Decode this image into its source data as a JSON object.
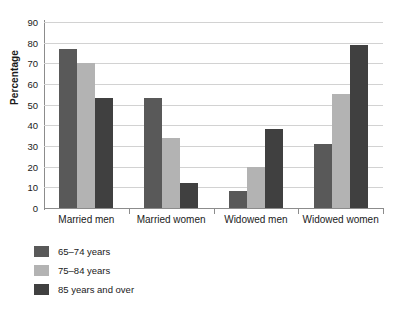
{
  "chart_data": {
    "type": "bar",
    "title": "",
    "xlabel": "",
    "ylabel": "Percentage",
    "ylim": [
      0,
      90
    ],
    "ytick_step": 10,
    "yticks": [
      90,
      80,
      70,
      60,
      50,
      40,
      30,
      20,
      10,
      0
    ],
    "grid": true,
    "legend_position": "below-left",
    "categories": [
      "Married men",
      "Married women",
      "Widowed men",
      "Widowed women"
    ],
    "series": [
      {
        "name": "65–74 years",
        "color": "#595959",
        "values": [
          77,
          53,
          8,
          31
        ]
      },
      {
        "name": "75–84 years",
        "color": "#b3b3b3",
        "values": [
          70,
          34,
          20,
          55
        ]
      },
      {
        "name": "85 years and over",
        "color": "#404040",
        "values": [
          53,
          12,
          38,
          79
        ]
      }
    ]
  },
  "colors": {
    "axis": "#8c8c8c",
    "grid": "#d2d2d2",
    "text": "#1a1a1a",
    "background": "#ffffff"
  }
}
